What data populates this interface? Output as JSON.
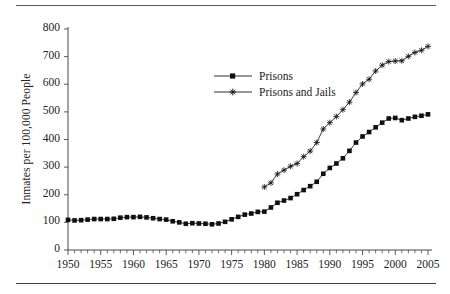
{
  "figure": {
    "name": "incarceration-rate-line-chart",
    "rules": {
      "top": true,
      "bottom": true
    }
  },
  "legend": {
    "position": "inside-upper-center",
    "items": [
      {
        "label": "Prisons",
        "marker": "square"
      },
      {
        "label": "Prisons and Jails",
        "marker": "star"
      }
    ]
  },
  "chart_data": {
    "type": "line",
    "title": "",
    "xlabel": "",
    "ylabel": "Inmates per 100,000 People",
    "xlim": [
      1950,
      2005
    ],
    "ylim": [
      0,
      800
    ],
    "yticks": [
      0,
      100,
      200,
      300,
      400,
      500,
      600,
      700,
      800
    ],
    "ytick_labels": [
      "0",
      "100",
      "200",
      "300",
      "400",
      "500",
      "600",
      "700",
      "800"
    ],
    "xticks": [
      1950,
      1955,
      1960,
      1965,
      1970,
      1975,
      1980,
      1985,
      1990,
      1995,
      2000,
      2005
    ],
    "xtick_labels": [
      "1950",
      "1955",
      "1960",
      "1965",
      "1970",
      "1975",
      "1980",
      "1985",
      "1990",
      "1995",
      "2000",
      "2005"
    ],
    "x_minor_tick_interval": 1,
    "grid": false,
    "legend_position": "inside-upper-center",
    "series": [
      {
        "name": "Prisons",
        "marker": "square",
        "x": [
          1950,
          1951,
          1952,
          1953,
          1954,
          1955,
          1956,
          1957,
          1958,
          1959,
          1960,
          1961,
          1962,
          1963,
          1964,
          1965,
          1966,
          1967,
          1968,
          1969,
          1970,
          1971,
          1972,
          1973,
          1974,
          1975,
          1976,
          1977,
          1978,
          1979,
          1980,
          1981,
          1982,
          1983,
          1984,
          1985,
          1986,
          1987,
          1988,
          1989,
          1990,
          1991,
          1992,
          1993,
          1994,
          1995,
          1996,
          1997,
          1998,
          1999,
          2000,
          2001,
          2002,
          2003,
          2004,
          2005
        ],
        "values": [
          109,
          107,
          108,
          110,
          112,
          112,
          112,
          113,
          117,
          119,
          119,
          120,
          118,
          115,
          112,
          110,
          104,
          100,
          95,
          97,
          96,
          95,
          93,
          96,
          102,
          111,
          120,
          128,
          132,
          138,
          139,
          154,
          171,
          179,
          188,
          202,
          217,
          231,
          247,
          276,
          297,
          313,
          332,
          359,
          389,
          411,
          427,
          444,
          461,
          476,
          478,
          470,
          476,
          482,
          486,
          491
        ]
      },
      {
        "name": "Prisons and Jails",
        "marker": "star",
        "x": [
          1980,
          1981,
          1982,
          1983,
          1984,
          1985,
          1986,
          1987,
          1988,
          1989,
          1990,
          1991,
          1992,
          1993,
          1994,
          1995,
          1996,
          1997,
          1998,
          1999,
          2000,
          2001,
          2002,
          2003,
          2004,
          2005
        ],
        "values": [
          228,
          243,
          275,
          289,
          303,
          313,
          338,
          358,
          389,
          438,
          461,
          483,
          508,
          535,
          570,
          601,
          618,
          648,
          669,
          682,
          684,
          685,
          701,
          715,
          723,
          737
        ]
      }
    ]
  }
}
